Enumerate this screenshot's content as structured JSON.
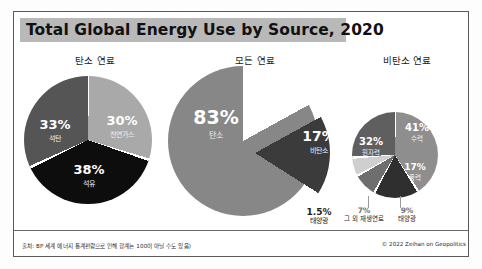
{
  "header": {
    "title": "Total Global Energy Use by Source, 2020"
  },
  "sections": {
    "left_header": "탄소 연료",
    "center_header": "모든 연료",
    "right_header": "비탄소 연료"
  },
  "footer": {
    "source_note": "출처: BP 세계 에너지 통계편람으로 인해 합계는 100이 아닐 수도 있음)",
    "copyright": "© 2022 Zeihan on Geopolitics"
  },
  "colors": {
    "title_band": "#b9b9b9",
    "coal": "#555555",
    "natural_gas": "#a9a9a9",
    "oil": "#0d0d0d",
    "carbon": "#878787",
    "noncarbon": "#3b3b3b",
    "hydro": "#8e8e8e",
    "nuclear": "#5f5f5f",
    "wind": "#2f2f2f",
    "solar": "#6e6e6e",
    "other_renewables": "#cfcfcf"
  },
  "chart_data": [
    {
      "type": "pie",
      "title": "탄소 연료",
      "categories": [
        "석유",
        "석탄",
        "천연가스"
      ],
      "values": [
        38,
        33,
        30
      ],
      "labels": [
        "38%",
        "33%",
        "30%"
      ]
    },
    {
      "type": "pie",
      "title": "모든 연료",
      "categories": [
        "탄소",
        "비탄소"
      ],
      "values": [
        83,
        17
      ],
      "labels": [
        "83%",
        "17%"
      ],
      "exploded": [
        "비탄소"
      ]
    },
    {
      "type": "pie",
      "title": "비탄소 연료",
      "categories": [
        "수력",
        "원자력",
        "풍력",
        "태양광",
        "그 외 재생연료"
      ],
      "values": [
        41,
        32,
        17,
        9,
        7
      ],
      "labels": [
        "41%",
        "32%",
        "17%",
        "9%",
        "7%"
      ]
    }
  ],
  "slices": {
    "coal": {
      "pct": "33%",
      "name": "석탄"
    },
    "gas": {
      "pct": "30%",
      "name": "천연가스"
    },
    "oil": {
      "pct": "38%",
      "name": "석유"
    },
    "carbon": {
      "pct": "83%",
      "name": "탄소"
    },
    "noncarbon": {
      "pct": "17%",
      "name": "비탄소"
    },
    "hydro": {
      "pct": "41%",
      "name": "수력"
    },
    "nuclear": {
      "pct": "32%",
      "name": "원자력"
    },
    "wind": {
      "pct": "17%",
      "name": "풍력"
    },
    "solar_small": {
      "pct": "9%",
      "name": "태양광"
    },
    "other_renew": {
      "pct": "7%",
      "name": "그 외\n재생연료"
    },
    "solar_total": {
      "pct": "1.5%",
      "name": "태양광"
    }
  }
}
